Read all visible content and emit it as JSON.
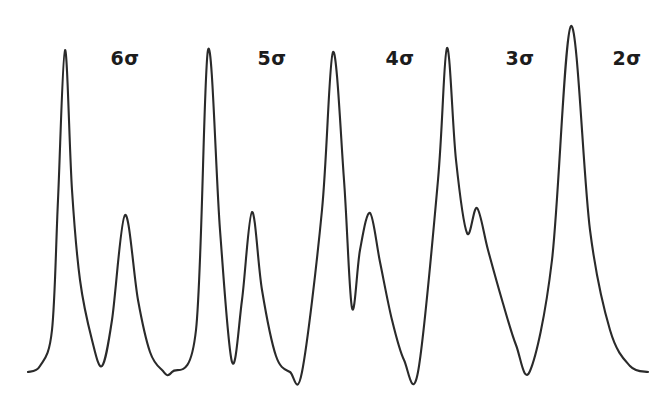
{
  "figure": {
    "kind": "spectrum-trace",
    "width": 665,
    "height": 400,
    "background_color": "#ffffff",
    "trace_color": "#2a2a2a",
    "trace_width": 2.1,
    "baseline_y": 372
  },
  "labels": [
    {
      "id": "label-6-sigma",
      "text": "6σ",
      "digit": "6",
      "symbol": "σ",
      "x": 125,
      "y": 58
    },
    {
      "id": "label-5-sigma",
      "text": "5σ",
      "digit": "5",
      "symbol": "σ",
      "x": 272,
      "y": 58
    },
    {
      "id": "label-4-sigma",
      "text": "4σ",
      "digit": "4",
      "symbol": "σ",
      "x": 400,
      "y": 58
    },
    {
      "id": "label-3-sigma",
      "text": "3σ",
      "digit": "3",
      "symbol": "σ",
      "x": 520,
      "y": 58
    },
    {
      "id": "label-2-sigma",
      "text": "2σ",
      "digit": "2",
      "symbol": "σ",
      "x": 627,
      "y": 58
    }
  ],
  "chart_data": {
    "type": "line",
    "title": "",
    "xlabel": "",
    "ylabel": "",
    "grid": false,
    "legend": "none",
    "axis_visible": false,
    "xlim": [
      0,
      665
    ],
    "ylim": [
      400,
      0
    ],
    "baseline_y": 372,
    "annotations": [
      "6σ",
      "5σ",
      "4σ",
      "3σ",
      "2σ"
    ],
    "peaks": [
      {
        "name": "major-peak-1",
        "x": 65,
        "apex_y": 50,
        "height": 322,
        "class": "major"
      },
      {
        "name": "minor-peak-1",
        "x": 125,
        "apex_y": 215,
        "height": 157,
        "class": "minor"
      },
      {
        "name": "major-peak-2",
        "x": 208,
        "apex_y": 50,
        "height": 322,
        "class": "major"
      },
      {
        "name": "minor-peak-2",
        "x": 252,
        "apex_y": 212,
        "height": 160,
        "class": "minor"
      },
      {
        "name": "major-peak-3",
        "x": 333,
        "apex_y": 52,
        "height": 320,
        "class": "major"
      },
      {
        "name": "minor-peak-3",
        "x": 370,
        "apex_y": 213,
        "height": 159,
        "class": "minor"
      },
      {
        "name": "major-peak-4",
        "x": 447,
        "apex_y": 48,
        "height": 324,
        "class": "major"
      },
      {
        "name": "shoulder-peak-4",
        "x": 477,
        "apex_y": 208,
        "height": 164,
        "class": "shoulder"
      },
      {
        "name": "major-peak-5",
        "x": 571,
        "apex_y": 26,
        "height": 346,
        "class": "major"
      }
    ],
    "valleys": [
      {
        "name": "valley-1",
        "x": 102,
        "y": 366
      },
      {
        "name": "valley-2",
        "x": 168,
        "y": 372
      },
      {
        "name": "valley-3",
        "x": 232,
        "y": 362
      },
      {
        "name": "valley-4",
        "x": 296,
        "y": 372
      },
      {
        "name": "valley-5",
        "x": 352,
        "y": 308
      },
      {
        "name": "valley-6",
        "x": 410,
        "y": 372
      },
      {
        "name": "valley-7",
        "x": 467,
        "y": 233
      },
      {
        "name": "valley-8",
        "x": 525,
        "y": 372
      }
    ],
    "trace_start": {
      "x": 28,
      "y": 372
    },
    "trace_end": {
      "x": 648,
      "y": 372
    },
    "x": [
      28,
      40,
      52,
      58,
      65,
      72,
      80,
      92,
      102,
      112,
      125,
      138,
      150,
      162,
      172,
      196,
      208,
      220,
      232,
      242,
      252,
      262,
      276,
      290,
      302,
      322,
      333,
      344,
      352,
      360,
      370,
      380,
      392,
      404,
      418,
      438,
      447,
      456,
      467,
      477,
      488,
      502,
      516,
      530,
      552,
      571,
      590,
      610,
      630,
      648
    ],
    "y": [
      372,
      366,
      330,
      200,
      50,
      190,
      280,
      340,
      366,
      320,
      215,
      300,
      352,
      370,
      372,
      330,
      50,
      230,
      362,
      300,
      212,
      290,
      356,
      372,
      372,
      210,
      52,
      180,
      308,
      250,
      213,
      262,
      320,
      360,
      372,
      180,
      48,
      160,
      233,
      208,
      250,
      300,
      345,
      371,
      260,
      26,
      230,
      330,
      366,
      372
    ]
  }
}
